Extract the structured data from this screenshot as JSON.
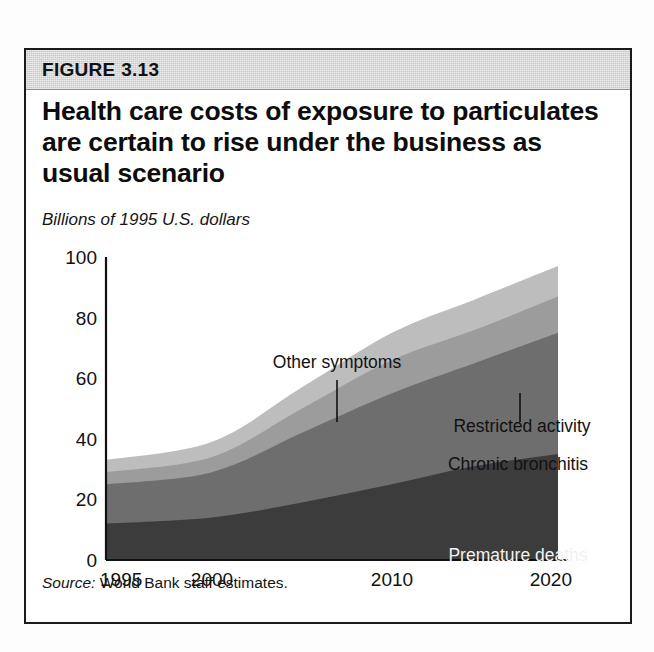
{
  "figure": {
    "label": "FIGURE 3.13",
    "title": "Health care costs of exposure to particulates are certain to rise under the business as usual scenario",
    "subtitle": "Billions of 1995 U.S. dollars",
    "source_word": "Source:",
    "source_text": "World Bank staff estimates.",
    "header_bg": "#c9c9c9",
    "border_color": "#1a1a1a"
  },
  "chart_data": {
    "type": "area",
    "stacked": true,
    "title": "Health care costs of exposure to particulates are certain to rise under the business as usual scenario",
    "subtitle": "Billions of 1995 U.S. dollars",
    "xlabel": "",
    "ylabel": "Billions of 1995 U.S. dollars",
    "x": [
      1995,
      2000,
      2005,
      2010,
      2015,
      2020
    ],
    "xtick_labels": [
      "1995",
      "2000",
      "2010",
      "2020"
    ],
    "xtick_values": [
      1995,
      2000,
      2010,
      2020
    ],
    "xlim": [
      1995,
      2020
    ],
    "ytick_labels": [
      "0",
      "20",
      "40",
      "60",
      "80",
      "100"
    ],
    "ytick_values": [
      0,
      20,
      40,
      60,
      80,
      100
    ],
    "ylim": [
      0,
      100
    ],
    "grid": false,
    "legend": "inline-annotations",
    "series": [
      {
        "name": "Premature deaths",
        "color": "#3c3c3c",
        "label_color": "#f2f2f2",
        "values": [
          12,
          14,
          19,
          25,
          31,
          35
        ]
      },
      {
        "name": "Chronic bronchitis",
        "color": "#6e6e6e",
        "label_color": "#111111",
        "values": [
          13,
          15,
          23,
          30,
          34,
          40
        ]
      },
      {
        "name": "Restricted activity",
        "color": "#9c9c9c",
        "label_color": "#111111",
        "values": [
          4,
          5,
          8,
          11,
          11,
          12
        ]
      },
      {
        "name": "Other symptoms",
        "color": "#bdbdbd",
        "label_color": "#111111",
        "values": [
          4,
          5,
          7,
          9,
          10,
          10
        ]
      }
    ],
    "cumulative_tops": {
      "Premature deaths": [
        12,
        14,
        19,
        25,
        31,
        35
      ],
      "Chronic bronchitis": [
        25,
        29,
        42,
        55,
        65,
        75
      ],
      "Restricted activity": [
        29,
        34,
        50,
        66,
        76,
        87
      ],
      "Other symptoms": [
        33,
        39,
        57,
        75,
        86,
        97
      ]
    },
    "annotations": [
      {
        "text": "Other symptoms",
        "x": 311,
        "y": 318,
        "anchor": "middle",
        "leader": {
          "x": 311,
          "y1": 330,
          "y2": 372
        }
      },
      {
        "text": "Restricted activity",
        "x": 496,
        "y": 382,
        "anchor": "middle",
        "leader": {
          "x": 494,
          "y1": 343,
          "y2": 372
        }
      },
      {
        "text": "Chronic bronchitis",
        "x": 492,
        "y": 420,
        "anchor": "middle",
        "leader": null
      },
      {
        "text": "Premature deaths",
        "x": 492,
        "y": 511,
        "anchor": "middle",
        "leader": null
      }
    ]
  }
}
